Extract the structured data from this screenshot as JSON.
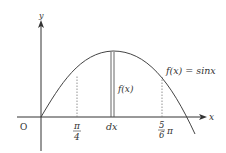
{
  "diagram": {
    "type": "function-graph",
    "function_label": "f(x) = sinx",
    "axes": {
      "x_label": "x",
      "y_label": "y",
      "origin_label": "O"
    },
    "x_ticks": [
      {
        "name": "pi-over-4",
        "numerator": "π",
        "denominator": "4"
      },
      {
        "name": "dx",
        "text": "dx"
      },
      {
        "name": "five-sixths-pi",
        "numerator": "5",
        "denominator": "6",
        "suffix": "π"
      }
    ],
    "strip_label": "f(x)",
    "colors": {
      "curve": "#444444",
      "axis": "#333333",
      "dotted": "#777777"
    }
  }
}
